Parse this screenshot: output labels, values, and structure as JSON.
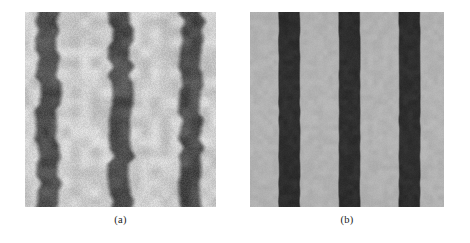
{
  "figure": {
    "background_color": "#ffffff",
    "panel_count": 2,
    "panels": [
      {
        "id": "a",
        "caption": "(a)",
        "description": "noisy blurred vertical stripe pattern",
        "geometry": {
          "x": 25,
          "y": 12,
          "width": 191,
          "height": 195
        },
        "chart_data": {
          "type": "heatmap",
          "title": "",
          "xlabel": "",
          "ylabel": "",
          "orientation": "vertical-stripes",
          "stripe_count": 3,
          "background_level": "#c9c9c9",
          "stripe_level": "#4c4c4c",
          "stripe_centers_pct": [
            12,
            50,
            87
          ],
          "stripe_width_pct": 11,
          "edge_softness_px": 7,
          "edge_waviness_px": 3.2,
          "noise_amplitude": 22,
          "noise_grain_px": 2,
          "levels": {
            "min": 58,
            "max": 214
          }
        }
      },
      {
        "id": "b",
        "caption": "(b)",
        "description": "smoothed sharp-edged vertical stripe pattern",
        "geometry": {
          "x": 250,
          "y": 12,
          "width": 194,
          "height": 195
        },
        "chart_data": {
          "type": "heatmap",
          "title": "",
          "xlabel": "",
          "ylabel": "",
          "orientation": "vertical-stripes",
          "stripe_count": 3,
          "background_level": "#b0b0b0",
          "stripe_level": "#2c2c2c",
          "stripe_centers_pct": [
            20,
            51,
            82
          ],
          "stripe_width_pct": 11,
          "edge_softness_px": 2,
          "edge_waviness_px": 0.4,
          "noise_amplitude": 7,
          "noise_grain_px": 1,
          "levels": {
            "min": 38,
            "max": 186
          }
        }
      }
    ]
  }
}
